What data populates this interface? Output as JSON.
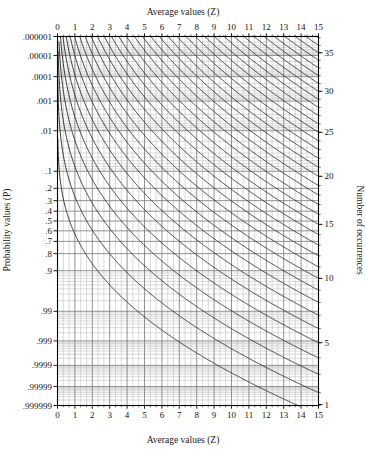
{
  "chart_data": {
    "type": "line",
    "title": "",
    "top_axis_label": "Average values (Z)",
    "bottom_axis_label": "Average values (Z)",
    "left_axis_label": "Probability values (P)",
    "right_axis_label": "Number of occurrences",
    "xlabel": "Average values (Z)",
    "ylabel": "Probability values (P)",
    "xlim": [
      0,
      15
    ],
    "grid": true,
    "legend_position": "none",
    "x_ticks": [
      0,
      1,
      2,
      3,
      4,
      5,
      6,
      7,
      8,
      9,
      10,
      11,
      12,
      13,
      14,
      15
    ],
    "x_tick_labels": [
      "0",
      "1",
      "2",
      "3",
      "4",
      "5",
      "6",
      "7",
      "8",
      "9",
      "10",
      "11",
      "12",
      "13",
      "14",
      "15"
    ],
    "x_minor_per_major": 2,
    "y_tick_labels": [
      ".000001",
      ".00001",
      ".0001",
      ".001",
      ".01",
      ".1",
      ".2",
      ".3",
      ".4",
      ".5",
      ".6",
      ".7",
      ".8",
      ".9",
      ".99",
      ".999",
      ".9999",
      ".99999",
      ".999999"
    ],
    "y_tick_values": [
      1e-06,
      1e-05,
      0.0001,
      0.001,
      0.01,
      0.1,
      0.2,
      0.3,
      0.4,
      0.5,
      0.6,
      0.7,
      0.8,
      0.9,
      0.99,
      0.999,
      0.9999,
      0.99999,
      0.999999
    ],
    "y_scale": "probit",
    "right_tick_labels": [
      "1",
      "5",
      "10",
      "15",
      "20",
      "25",
      "30",
      "35"
    ],
    "right_tick_values": [
      1,
      5,
      10,
      15,
      20,
      25,
      30,
      35
    ],
    "right_axis_range": [
      1,
      37
    ],
    "curve_family": "Poisson cumulative probability",
    "curve_label_meaning": "Each curve is one value of Number of occurrences (c); curve c gives P(X >= c) plotted on the probability scale versus the average value Z.",
    "curves": [
      {
        "c": 1,
        "name": "c = 1"
      },
      {
        "c": 2,
        "name": "c = 2"
      },
      {
        "c": 3,
        "name": "c = 3"
      },
      {
        "c": 4,
        "name": "c = 4"
      },
      {
        "c": 5,
        "name": "c = 5"
      },
      {
        "c": 6,
        "name": "c = 6"
      },
      {
        "c": 7,
        "name": "c = 7"
      },
      {
        "c": 8,
        "name": "c = 8"
      },
      {
        "c": 9,
        "name": "c = 9"
      },
      {
        "c": 10,
        "name": "c = 10"
      },
      {
        "c": 11,
        "name": "c = 11"
      },
      {
        "c": 12,
        "name": "c = 12"
      },
      {
        "c": 13,
        "name": "c = 13"
      },
      {
        "c": 14,
        "name": "c = 14"
      },
      {
        "c": 15,
        "name": "c = 15"
      },
      {
        "c": 16,
        "name": "c = 16"
      },
      {
        "c": 17,
        "name": "c = 17"
      },
      {
        "c": 18,
        "name": "c = 18"
      },
      {
        "c": 19,
        "name": "c = 19"
      },
      {
        "c": 20,
        "name": "c = 20"
      },
      {
        "c": 21,
        "name": "c = 21"
      },
      {
        "c": 22,
        "name": "c = 22"
      },
      {
        "c": 23,
        "name": "c = 23"
      },
      {
        "c": 24,
        "name": "c = 24"
      },
      {
        "c": 25,
        "name": "c = 25"
      },
      {
        "c": 26,
        "name": "c = 26"
      },
      {
        "c": 27,
        "name": "c = 27"
      },
      {
        "c": 28,
        "name": "c = 28"
      },
      {
        "c": 29,
        "name": "c = 29"
      },
      {
        "c": 30,
        "name": "c = 30"
      },
      {
        "c": 31,
        "name": "c = 31"
      },
      {
        "c": 32,
        "name": "c = 32"
      },
      {
        "c": 33,
        "name": "c = 33"
      },
      {
        "c": 34,
        "name": "c = 34"
      },
      {
        "c": 35,
        "name": "c = 35"
      },
      {
        "c": 36,
        "name": "c = 36"
      },
      {
        "c": 37,
        "name": "c = 37"
      }
    ],
    "colors": {
      "background": "#ffffff",
      "curve": "#2a2a2a",
      "grid_major": "#777777",
      "grid_minor": "#bbbbbb",
      "axis": "#000000",
      "text": "#1a1a1a"
    }
  },
  "axes": {
    "top": {
      "label": "Average values (Z)"
    },
    "bottom": {
      "label": "Average values (Z)"
    },
    "left": {
      "label": "Probability values (P)"
    },
    "right": {
      "label": "Number of occurrences"
    }
  }
}
